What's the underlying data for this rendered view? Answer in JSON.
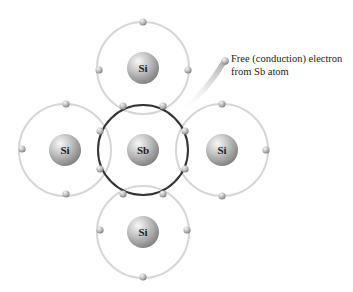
{
  "colors": {
    "background": "#ffffff",
    "orbit": "#d9d9d9",
    "sb_orbit": "#333333",
    "nucleus_light": "#f2f2f2",
    "nucleus_dark": "#8a8a8a",
    "electron_light": "#f0f0f0",
    "electron_dark": "#8c8c8c"
  },
  "atoms": [
    {
      "id": "si-top",
      "label": "Si",
      "cx": 143,
      "cy": 68
    },
    {
      "id": "si-left",
      "label": "Si",
      "cx": 65,
      "cy": 150
    },
    {
      "id": "sb-center",
      "label": "Sb",
      "cx": 143,
      "cy": 150
    },
    {
      "id": "si-right",
      "label": "Si",
      "cx": 222,
      "cy": 150
    },
    {
      "id": "si-bottom",
      "label": "Si",
      "cx": 143,
      "cy": 232
    }
  ],
  "annotation": {
    "line1": "Free (conduction) electron",
    "line2": "from Sb atom"
  }
}
